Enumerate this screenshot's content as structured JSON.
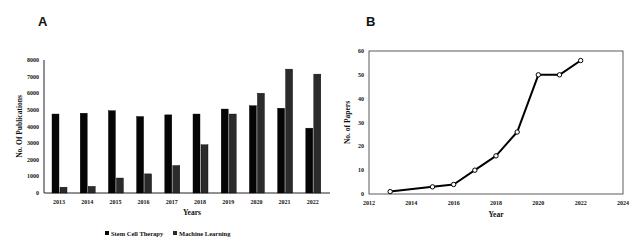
{
  "chart_data": [
    {
      "type": "bar",
      "panel": "A",
      "title": "",
      "xlabel": "Years",
      "ylabel": "No. Of Publications",
      "ylim": [
        0,
        8000
      ],
      "yticks": [
        "0",
        "1000",
        "2000",
        "3000",
        "4000",
        "5000",
        "6000",
        "7000",
        "8000"
      ],
      "categories": [
        "2013",
        "2014",
        "2015",
        "2016",
        "2017",
        "2018",
        "2019",
        "2020",
        "2021",
        "2022"
      ],
      "series": [
        {
          "name": "Stem Cell Therapy",
          "color": "#050505",
          "values": [
            4750,
            4800,
            4950,
            4600,
            4700,
            4750,
            5050,
            5250,
            5100,
            3900
          ]
        },
        {
          "name": "Machine Learning",
          "color": "#2b2b2b",
          "values": [
            350,
            400,
            900,
            1150,
            1650,
            2900,
            4750,
            6000,
            7450,
            7150
          ]
        }
      ],
      "legend": "bottom",
      "grid": false
    },
    {
      "type": "line",
      "panel": "B",
      "title": "",
      "xlabel": "Year",
      "ylabel": "No. of Papers",
      "xlim": [
        2012,
        2024
      ],
      "ylim": [
        0,
        60
      ],
      "xticks": [
        "2012",
        "2014",
        "2016",
        "2018",
        "2020",
        "2022",
        "2024"
      ],
      "yticks": [
        "0",
        "10",
        "20",
        "30",
        "40",
        "50",
        "60"
      ],
      "series": [
        {
          "name": "Papers",
          "color": "#000000",
          "x": [
            2013,
            2015,
            2016,
            2017,
            2018,
            2019,
            2020,
            2021,
            2022
          ],
          "y": [
            1,
            3,
            4,
            10,
            16,
            26,
            50,
            50,
            56
          ]
        }
      ],
      "grid": false
    }
  ],
  "panels": {
    "a_label": "A",
    "b_label": "B"
  }
}
